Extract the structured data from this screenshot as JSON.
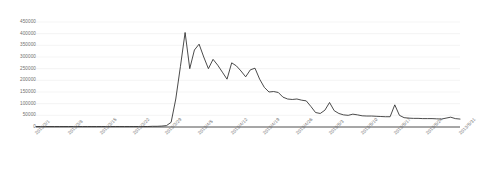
{
  "chart_data": {
    "type": "line",
    "title": "",
    "subtitle": "",
    "xlabel": "",
    "ylabel": "",
    "ylim": [
      0,
      450000
    ],
    "ytick_step": 50000,
    "yticks": [
      0,
      50000,
      100000,
      150000,
      200000,
      250000,
      300000,
      350000,
      400000,
      450000
    ],
    "ytick_labels": [
      "0",
      "50000",
      "100000",
      "150000",
      "200000",
      "250000",
      "300000",
      "350000",
      "400000",
      "450000"
    ],
    "xticks": [
      "2013/3/1",
      "2013/3/8",
      "2013/3/15",
      "2013/3/22",
      "2013/3/29",
      "2013/4/5",
      "2013/4/12",
      "2013/4/19",
      "2013/4/26",
      "2013/5/3",
      "2013/5/10",
      "2013/5/17",
      "2013/5/24",
      "2013/5/31"
    ],
    "grid": "horizontal",
    "legend": "none",
    "series": [
      {
        "name": "series-1",
        "color": "#2b2b2b",
        "x": [
          "2013/3/1",
          "2013/3/2",
          "2013/3/3",
          "2013/3/4",
          "2013/3/5",
          "2013/3/6",
          "2013/3/7",
          "2013/3/8",
          "2013/3/9",
          "2013/3/10",
          "2013/3/11",
          "2013/3/12",
          "2013/3/13",
          "2013/3/14",
          "2013/3/15",
          "2013/3/16",
          "2013/3/17",
          "2013/3/18",
          "2013/3/19",
          "2013/3/20",
          "2013/3/21",
          "2013/3/22",
          "2013/3/23",
          "2013/3/24",
          "2013/3/25",
          "2013/3/26",
          "2013/3/27",
          "2013/3/28",
          "2013/3/29",
          "2013/3/30",
          "2013/3/31",
          "2013/4/1",
          "2013/4/2",
          "2013/4/3",
          "2013/4/4",
          "2013/4/5",
          "2013/4/6",
          "2013/4/7",
          "2013/4/8",
          "2013/4/9",
          "2013/4/10",
          "2013/4/11",
          "2013/4/12",
          "2013/4/13",
          "2013/4/14",
          "2013/4/15",
          "2013/4/16",
          "2013/4/17",
          "2013/4/18",
          "2013/4/19",
          "2013/4/20",
          "2013/4/21",
          "2013/4/22",
          "2013/4/23",
          "2013/4/24",
          "2013/4/25",
          "2013/4/26",
          "2013/4/27",
          "2013/4/28",
          "2013/4/29",
          "2013/4/30",
          "2013/5/1",
          "2013/5/2",
          "2013/5/3",
          "2013/5/4",
          "2013/5/5",
          "2013/5/6",
          "2013/5/7",
          "2013/5/8",
          "2013/5/9",
          "2013/5/10",
          "2013/5/11",
          "2013/5/12",
          "2013/5/13",
          "2013/5/14",
          "2013/5/15",
          "2013/5/16",
          "2013/5/17",
          "2013/5/18",
          "2013/5/19",
          "2013/5/20",
          "2013/5/21",
          "2013/5/22",
          "2013/5/23",
          "2013/5/24",
          "2013/5/25",
          "2013/5/26",
          "2013/5/27",
          "2013/5/28",
          "2013/5/29",
          "2013/5/30",
          "2013/5/31"
        ],
        "values": [
          2000,
          2000,
          2000,
          2000,
          2000,
          2000,
          2000,
          2000,
          2000,
          2000,
          2000,
          2000,
          2000,
          2000,
          2000,
          2000,
          2000,
          2000,
          2000,
          2000,
          2000,
          2000,
          2000,
          2000,
          2000,
          3000,
          3000,
          4000,
          6000,
          20000,
          120000,
          260000,
          405000,
          250000,
          330000,
          355000,
          300000,
          250000,
          290000,
          265000,
          235000,
          205000,
          275000,
          262000,
          240000,
          215000,
          245000,
          252000,
          205000,
          170000,
          150000,
          152000,
          148000,
          128000,
          120000,
          118000,
          120000,
          115000,
          112000,
          88000,
          62000,
          58000,
          72000,
          105000,
          70000,
          58000,
          52000,
          50000,
          55000,
          52000,
          48000,
          47000,
          47000,
          46000,
          45000,
          44000,
          44000,
          95000,
          50000,
          40000,
          38000,
          37000,
          37000,
          36000,
          36000,
          36000,
          35000,
          34000,
          38000,
          42000,
          36000,
          34000
        ]
      }
    ]
  }
}
